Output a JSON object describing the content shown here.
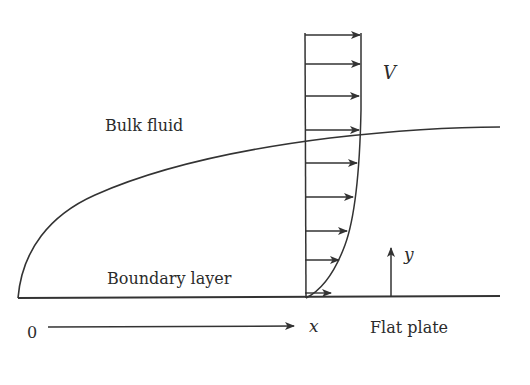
{
  "labels": {
    "bulk_fluid": "Bulk fluid",
    "boundary_layer": "Boundary layer",
    "velocity": "V",
    "origin": "0",
    "x_axis": "x",
    "y_axis": "y",
    "flat_plate": "Flat plate"
  },
  "colors": {
    "stroke": "#333333",
    "text": "#2b2b2b",
    "background": "#ffffff"
  },
  "velocity_profile": {
    "base_x": 305,
    "arrows": [
      {
        "y": 35,
        "tip_x": 360
      },
      {
        "y": 64,
        "tip_x": 360
      },
      {
        "y": 96,
        "tip_x": 359
      },
      {
        "y": 130,
        "tip_x": 359
      },
      {
        "y": 163,
        "tip_x": 357
      },
      {
        "y": 197,
        "tip_x": 353
      },
      {
        "y": 231,
        "tip_x": 347
      },
      {
        "y": 260,
        "tip_x": 339
      },
      {
        "y": 293,
        "tip_x": 331
      }
    ]
  }
}
